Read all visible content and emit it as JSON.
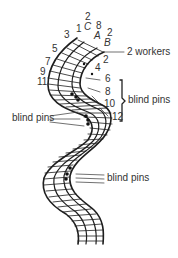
{
  "figure": {
    "type": "lace braid diagram",
    "stroke_color": "#1e1e1e",
    "label_color": "#333333"
  },
  "labels": {
    "pin_1": "1",
    "pin_2_top": "2",
    "pin_3": "3",
    "pin_5": "5",
    "pin_7": "7",
    "pin_9": "9",
    "pin_11": "11",
    "pin_8_top": "8",
    "pin_2_right": "2",
    "pin_2_inner": "2",
    "pin_4": "4",
    "pin_6": "6",
    "pin_8": "8",
    "pin_10": "10",
    "pin_12": "12",
    "letter_c": "C",
    "letter_a": "A",
    "letter_b": "B",
    "workers": "2 workers",
    "blind_pins_upper_right": "blind pins",
    "blind_pins_left": "blind pins",
    "blind_pins_lower_right": "blind pins"
  }
}
